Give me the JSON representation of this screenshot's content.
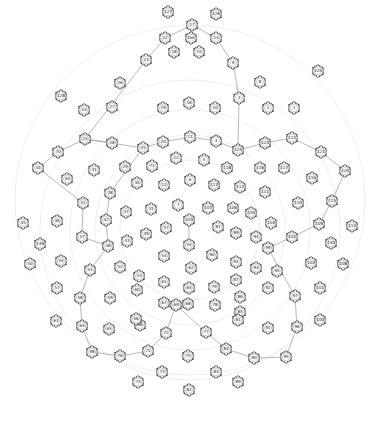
{
  "diagram": {
    "title": "",
    "colors": {
      "background": "#ffffff",
      "node_stroke": "#333333",
      "edge": "#999999",
      "arc": "#dddddd"
    },
    "nodes": [
      {
        "id": "127",
        "x": 168,
        "y": 12
      },
      {
        "id": "126",
        "x": 216,
        "y": 14
      },
      {
        "id": "17",
        "x": 192,
        "y": 25
      },
      {
        "id": "22",
        "x": 165,
        "y": 38
      },
      {
        "id": "Del",
        "x": 191,
        "y": 38
      },
      {
        "id": "14",
        "x": 216,
        "y": 38
      },
      {
        "id": "26",
        "x": 120,
        "y": 83
      },
      {
        "id": "23",
        "x": 146,
        "y": 60
      },
      {
        "id": "18",
        "x": 174,
        "y": 52
      },
      {
        "id": "15",
        "x": 199,
        "y": 52
      },
      {
        "id": "9",
        "x": 233,
        "y": 63
      },
      {
        "id": "8",
        "x": 260,
        "y": 82
      },
      {
        "id": "125",
        "x": 318,
        "y": 71
      },
      {
        "id": "128",
        "x": 61,
        "y": 96
      },
      {
        "id": "53",
        "x": 84,
        "y": 110
      },
      {
        "id": "27",
        "x": 112,
        "y": 107
      },
      {
        "id": "19",
        "x": 163,
        "y": 108
      },
      {
        "id": "16",
        "x": 189,
        "y": 103
      },
      {
        "id": "10",
        "x": 215,
        "y": 108
      },
      {
        "id": "3",
        "x": 239,
        "y": 98
      },
      {
        "id": "2",
        "x": 268,
        "y": 108
      },
      {
        "id": "1",
        "x": 294,
        "y": 108
      },
      {
        "id": "24",
        "x": 85,
        "y": 139
      },
      {
        "id": "28",
        "x": 112,
        "y": 143
      },
      {
        "id": "25",
        "x": 143,
        "y": 148
      },
      {
        "id": "20",
        "x": 163,
        "y": 142
      },
      {
        "id": "11",
        "x": 190,
        "y": 137
      },
      {
        "id": "4",
        "x": 216,
        "y": 141
      },
      {
        "id": "124",
        "x": 238,
        "y": 150
      },
      {
        "id": "123",
        "x": 265,
        "y": 143
      },
      {
        "id": "122",
        "x": 292,
        "y": 138
      },
      {
        "id": "121",
        "x": 321,
        "y": 152
      },
      {
        "id": "44",
        "x": 38,
        "y": 168
      },
      {
        "id": "70",
        "x": 58,
        "y": 152
      },
      {
        "id": "31",
        "x": 94,
        "y": 170
      },
      {
        "id": "29",
        "x": 125,
        "y": 167
      },
      {
        "id": "71",
        "x": 152,
        "y": 166
      },
      {
        "id": "12",
        "x": 176,
        "y": 158
      },
      {
        "id": "5",
        "x": 204,
        "y": 160
      },
      {
        "id": "118",
        "x": 227,
        "y": 168
      },
      {
        "id": "116",
        "x": 260,
        "y": 168
      },
      {
        "id": "117",
        "x": 284,
        "y": 168
      },
      {
        "id": "116b",
        "x": 312,
        "y": 178
      },
      {
        "id": "120",
        "x": 345,
        "y": 171
      },
      {
        "id": "43",
        "x": 67,
        "y": 179
      },
      {
        "id": "41",
        "x": 83,
        "y": 203
      },
      {
        "id": "38",
        "x": 110,
        "y": 193
      },
      {
        "id": "30",
        "x": 137,
        "y": 183
      },
      {
        "id": "13",
        "x": 164,
        "y": 185
      },
      {
        "id": "6",
        "x": 190,
        "y": 180
      },
      {
        "id": "113",
        "x": 214,
        "y": 185
      },
      {
        "id": "112",
        "x": 240,
        "y": 187
      },
      {
        "id": "111",
        "x": 265,
        "y": 192
      },
      {
        "id": "110",
        "x": 298,
        "y": 203
      },
      {
        "id": "115",
        "x": 332,
        "y": 201
      },
      {
        "id": "42",
        "x": 106,
        "y": 220
      },
      {
        "id": "37",
        "x": 126,
        "y": 212
      },
      {
        "id": "31b",
        "x": 151,
        "y": 209
      },
      {
        "id": "7",
        "x": 178,
        "y": 205
      },
      {
        "id": "107",
        "x": 208,
        "y": 208
      },
      {
        "id": "106",
        "x": 233,
        "y": 208
      },
      {
        "id": "105",
        "x": 251,
        "y": 213
      },
      {
        "id": "104",
        "x": 271,
        "y": 223
      },
      {
        "id": "109",
        "x": 319,
        "y": 224
      },
      {
        "id": "114",
        "x": 352,
        "y": 226
      },
      {
        "id": "45",
        "x": 23,
        "y": 223
      },
      {
        "id": "46",
        "x": 57,
        "y": 221
      },
      {
        "id": "47",
        "x": 82,
        "y": 237
      },
      {
        "id": "48",
        "x": 108,
        "y": 246
      },
      {
        "id": "43b",
        "x": 127,
        "y": 241
      },
      {
        "id": "39",
        "x": 146,
        "y": 234
      },
      {
        "id": "57",
        "x": 166,
        "y": 228
      },
      {
        "id": "103",
        "x": 189,
        "y": 220
      },
      {
        "id": "81",
        "x": 218,
        "y": 227
      },
      {
        "id": "89",
        "x": 236,
        "y": 233
      },
      {
        "id": "94",
        "x": 256,
        "y": 237
      },
      {
        "id": "99",
        "x": 268,
        "y": 248
      },
      {
        "id": "102",
        "x": 292,
        "y": 237
      },
      {
        "id": "140",
        "x": 331,
        "y": 243
      },
      {
        "id": "149",
        "x": 40,
        "y": 244
      },
      {
        "id": "50",
        "x": 30,
        "y": 264
      },
      {
        "id": "55",
        "x": 61,
        "y": 261
      },
      {
        "id": "51",
        "x": 90,
        "y": 270
      },
      {
        "id": "52",
        "x": 120,
        "y": 267
      },
      {
        "id": "53b",
        "x": 139,
        "y": 276
      },
      {
        "id": "54",
        "x": 164,
        "y": 256
      },
      {
        "id": "55b",
        "x": 189,
        "y": 245
      },
      {
        "id": "90",
        "x": 212,
        "y": 255
      },
      {
        "id": "91",
        "x": 236,
        "y": 262
      },
      {
        "id": "93",
        "x": 256,
        "y": 268
      },
      {
        "id": "95",
        "x": 277,
        "y": 271
      },
      {
        "id": "103b",
        "x": 311,
        "y": 263
      },
      {
        "id": "108",
        "x": 343,
        "y": 264
      },
      {
        "id": "57b",
        "x": 57,
        "y": 288
      },
      {
        "id": "58",
        "x": 80,
        "y": 298
      },
      {
        "id": "59",
        "x": 110,
        "y": 298
      },
      {
        "id": "60",
        "x": 137,
        "y": 290
      },
      {
        "id": "61",
        "x": 164,
        "y": 282
      },
      {
        "id": "62",
        "x": 191,
        "y": 268
      },
      {
        "id": "65",
        "x": 189,
        "y": 288
      },
      {
        "id": "79",
        "x": 214,
        "y": 287
      },
      {
        "id": "87",
        "x": 236,
        "y": 280
      },
      {
        "id": "86",
        "x": 240,
        "y": 297
      },
      {
        "id": "92",
        "x": 268,
        "y": 288
      },
      {
        "id": "97",
        "x": 295,
        "y": 296
      },
      {
        "id": "101",
        "x": 320,
        "y": 288
      },
      {
        "id": "63",
        "x": 56,
        "y": 321
      },
      {
        "id": "64",
        "x": 82,
        "y": 326
      },
      {
        "id": "65b",
        "x": 109,
        "y": 329
      },
      {
        "id": "66",
        "x": 140,
        "y": 325
      },
      {
        "id": "67",
        "x": 164,
        "y": 303
      },
      {
        "id": "68",
        "x": 188,
        "y": 304
      },
      {
        "id": "78",
        "x": 215,
        "y": 305
      },
      {
        "id": "85",
        "x": 240,
        "y": 312
      },
      {
        "id": "91b",
        "x": 268,
        "y": 328
      },
      {
        "id": "96",
        "x": 297,
        "y": 327
      },
      {
        "id": "100",
        "x": 320,
        "y": 320
      },
      {
        "id": "56",
        "x": 136,
        "y": 319
      },
      {
        "id": "69",
        "x": 176,
        "y": 305
      },
      {
        "id": "72",
        "x": 166,
        "y": 333
      },
      {
        "id": "77",
        "x": 206,
        "y": 332
      },
      {
        "id": "81b",
        "x": 238,
        "y": 320
      },
      {
        "id": "98",
        "x": 92,
        "y": 352
      },
      {
        "id": "76",
        "x": 120,
        "y": 356
      },
      {
        "id": "71b",
        "x": 148,
        "y": 351
      },
      {
        "id": "75",
        "x": 188,
        "y": 356
      },
      {
        "id": "84",
        "x": 226,
        "y": 349
      },
      {
        "id": "90b",
        "x": 254,
        "y": 358
      },
      {
        "id": "95b",
        "x": 286,
        "y": 357
      },
      {
        "id": "73",
        "x": 162,
        "y": 372
      },
      {
        "id": "74",
        "x": 138,
        "y": 382
      },
      {
        "id": "83",
        "x": 216,
        "y": 372
      },
      {
        "id": "89b",
        "x": 238,
        "y": 382
      },
      {
        "id": "82",
        "x": 189,
        "y": 390
      }
    ],
    "labels": {
      "127": "127",
      "126": "126",
      "17": "17",
      "22": "22",
      "Del": "Del",
      "14": "14",
      "26": "26",
      "23": "23",
      "18": "18",
      "15": "15",
      "9": "9",
      "8": "8",
      "125": "125",
      "128": "128",
      "53": "53",
      "27": "27",
      "19": "19",
      "16": "16",
      "10": "10",
      "3": "3",
      "2": "2",
      "1": "1",
      "24": "24",
      "28": "28",
      "25": "25",
      "20": "20",
      "11": "11",
      "4": "4",
      "124": "124",
      "123": "123",
      "122": "122",
      "121": "121",
      "44": "44",
      "70": "70",
      "31": "31",
      "29": "29",
      "71": "71",
      "12": "12",
      "5": "5",
      "118": "118",
      "116": "116",
      "117": "117",
      "116b": "116",
      "120": "120",
      "43": "40",
      "41": "41",
      "38": "38",
      "30": "30",
      "13": "13",
      "6": "6",
      "113": "113",
      "112": "112",
      "111": "111",
      "110": "110",
      "115": "115",
      "42": "42",
      "37": "37",
      "31b": "31",
      "7": "7",
      "107": "107",
      "106": "106",
      "105": "105",
      "104": "104",
      "109": "109",
      "114": "114",
      "45": "45",
      "46": "46",
      "47": "47",
      "48": "48",
      "43b": "43",
      "39": "39",
      "57": "57",
      "103": "103",
      "81": "81",
      "89": "89",
      "94": "94",
      "99": "99",
      "102": "102",
      "140": "140",
      "149": "149",
      "50": "50",
      "55": "55",
      "51": "51",
      "52": "52",
      "53b": "53",
      "54": "54",
      "55b": "55",
      "90": "90",
      "91": "91",
      "93": "93",
      "95": "95",
      "103b": "103",
      "108": "108",
      "57b": "57",
      "58": "58",
      "59": "59",
      "60": "60",
      "61": "61",
      "62": "62",
      "65": "65",
      "79": "79",
      "87": "87",
      "86": "86",
      "92": "92",
      "97": "97",
      "101": "101",
      "63": "63",
      "64": "64",
      "65b": "65",
      "66": "66",
      "67": "67",
      "68": "68",
      "78": "78",
      "85": "85",
      "91b": "91",
      "96": "96",
      "100": "100",
      "56": "56",
      "69": "69",
      "72": "72",
      "77": "77",
      "81b": "81",
      "98": "98",
      "76": "76",
      "71b": "71",
      "75": "75",
      "84": "84",
      "90b": "90",
      "95b": "95",
      "73": "73",
      "74": "74",
      "83": "83",
      "89b": "89",
      "82": "82"
    },
    "edges": [
      [
        "17",
        "22"
      ],
      [
        "17",
        "14"
      ],
      [
        "22",
        "23"
      ],
      [
        "23",
        "24"
      ],
      [
        "24",
        "25"
      ],
      [
        "14",
        "9"
      ],
      [
        "9",
        "3"
      ],
      [
        "3",
        "124"
      ],
      [
        "70",
        "24"
      ],
      [
        "24",
        "28"
      ],
      [
        "70",
        "44"
      ],
      [
        "44",
        "41"
      ],
      [
        "25",
        "20"
      ],
      [
        "20",
        "11"
      ],
      [
        "11",
        "4"
      ],
      [
        "4",
        "124"
      ],
      [
        "124",
        "123"
      ],
      [
        "123",
        "122"
      ],
      [
        "122",
        "121"
      ],
      [
        "121",
        "120"
      ],
      [
        "120",
        "115"
      ],
      [
        "115",
        "109"
      ],
      [
        "109",
        "102"
      ],
      [
        "102",
        "99"
      ],
      [
        "25",
        "38"
      ],
      [
        "38",
        "42"
      ],
      [
        "42",
        "48"
      ],
      [
        "48",
        "51"
      ],
      [
        "51",
        "58"
      ],
      [
        "58",
        "64"
      ],
      [
        "64",
        "98"
      ],
      [
        "98",
        "76"
      ],
      [
        "76",
        "71b"
      ],
      [
        "71b",
        "72"
      ],
      [
        "72",
        "69"
      ],
      [
        "69",
        "77"
      ],
      [
        "77",
        "84"
      ],
      [
        "84",
        "90b"
      ],
      [
        "90b",
        "95b"
      ],
      [
        "95b",
        "96"
      ],
      [
        "96",
        "97"
      ],
      [
        "97",
        "99"
      ],
      [
        "103",
        "55b"
      ],
      [
        "41",
        "47"
      ],
      [
        "47",
        "48"
      ]
    ]
  }
}
